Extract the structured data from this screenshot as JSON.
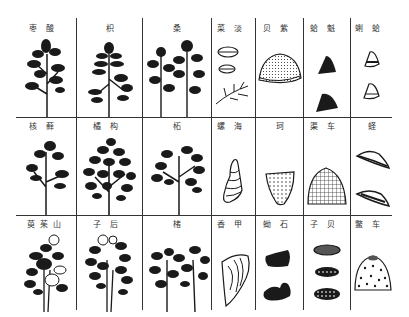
{
  "plate": {
    "rows": [
      {
        "cells": [
          {
            "label": "枣酸",
            "kind": "plant"
          },
          {
            "label": "枳",
            "kind": "plant"
          },
          {
            "label": "桑",
            "kind": "plant-double"
          },
          {
            "label": "菜淡",
            "kind": "shell-small-pair-seaweed"
          },
          {
            "label": "贝紫",
            "kind": "shell-dome-dotted"
          },
          {
            "label": "蛤魁",
            "kind": "shell-dark-pair"
          },
          {
            "label": "蜊蛤",
            "kind": "shell-cone-pair"
          }
        ]
      },
      {
        "cells": [
          {
            "label": "核藓",
            "kind": "plant"
          },
          {
            "label": "橘构",
            "kind": "plant-bushy"
          },
          {
            "label": "柘",
            "kind": "plant"
          },
          {
            "label": "螺海",
            "kind": "shell-spiral"
          },
          {
            "label": "珂",
            "kind": "shell-triangle-dotted"
          },
          {
            "label": "渠车",
            "kind": "shell-ribbed"
          },
          {
            "label": "蛏",
            "kind": "shell-razor-pair"
          }
        ]
      },
      {
        "cells": [
          {
            "label": "萸茱山",
            "kind": "plant-flowering"
          },
          {
            "label": "子后",
            "kind": "plant-flowering"
          },
          {
            "label": "楮",
            "kind": "plant-double"
          },
          {
            "label": "香甲",
            "kind": "shell-plate"
          },
          {
            "label": "蚴石",
            "kind": "stone-dark-pair"
          },
          {
            "label": "子贝",
            "kind": "shell-oval-triple"
          },
          {
            "label": "鳖车",
            "kind": "shell-spotted-dome"
          }
        ]
      }
    ]
  },
  "colors": {
    "ink": "#1a1a1a",
    "grid": "#333333",
    "paper": "#ffffff"
  }
}
